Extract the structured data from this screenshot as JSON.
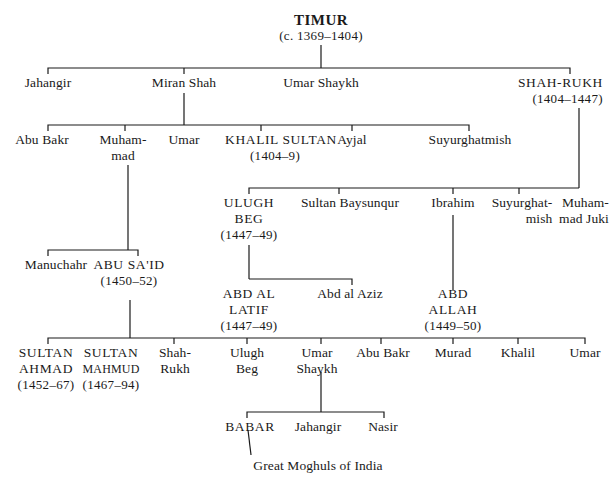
{
  "diagram": {
    "type": "family-tree",
    "root": {
      "name": "TIMUR",
      "dates": "(c. 1369–1404)"
    },
    "generation1": [
      {
        "name": "Jahangir"
      },
      {
        "name": "Miran Shah"
      },
      {
        "name": "Umar Shaykh"
      },
      {
        "name": "SHAH-RUKH",
        "dates": "(1404–1447)"
      }
    ],
    "miran_shah_children": [
      {
        "name": "Abu Bakr"
      },
      {
        "name_line1": "Muham-",
        "name_line2": "mad"
      },
      {
        "name": "Umar"
      },
      {
        "name": "KHALIL SULTAN",
        "dates": "(1404–9)"
      },
      {
        "name": "Ayjal"
      },
      {
        "name": "Suyurghatmish"
      }
    ],
    "shah_rukh_children": [
      {
        "name_line1": "ULUGH",
        "name_line2": "BEG",
        "dates": "(1447–49)"
      },
      {
        "name": "Sultan Baysunqur"
      },
      {
        "name": "Ibrahim"
      },
      {
        "name_line1": "Suyurghat-",
        "name_line2": "mish"
      },
      {
        "name_line1": "Muham-",
        "name_line2": "mad Juki"
      }
    ],
    "muhammad_children": [
      {
        "name": "Manuchahr"
      },
      {
        "name": "ABU SA'ID",
        "dates": "(1450–52)"
      }
    ],
    "ulugh_beg_children": [
      {
        "name_line1": "ABD AL",
        "name_line2": "LATIF",
        "dates": "(1447–49)"
      },
      {
        "name": "Abd al Aziz"
      }
    ],
    "ibrahim_children": [
      {
        "name_line1": "ABD",
        "name_line2": "ALLAH",
        "dates": "(1449–50)"
      }
    ],
    "abu_said_children": [
      {
        "name_line1": "SULTAN",
        "name_line2": "AHMAD",
        "dates": "(1452–67)"
      },
      {
        "name_line1": "SULTAN",
        "name_line2": "MAHMUD",
        "dates": "(1467–94)"
      },
      {
        "name_line1": "Shah-",
        "name_line2": "Rukh"
      },
      {
        "name_line1": "Ulugh",
        "name_line2": "Beg"
      },
      {
        "name_line1": "Umar",
        "name_line2": "Shaykh"
      },
      {
        "name": "Abu Bakr"
      },
      {
        "name": "Murad"
      },
      {
        "name": "Khalil"
      },
      {
        "name": "Umar"
      }
    ],
    "umar_shaykh_children": [
      {
        "name": "BABAR"
      },
      {
        "name": "Jahangir"
      },
      {
        "name": "Nasir"
      }
    ],
    "babar_descendants": {
      "name": "Great Moghuls of India"
    }
  }
}
